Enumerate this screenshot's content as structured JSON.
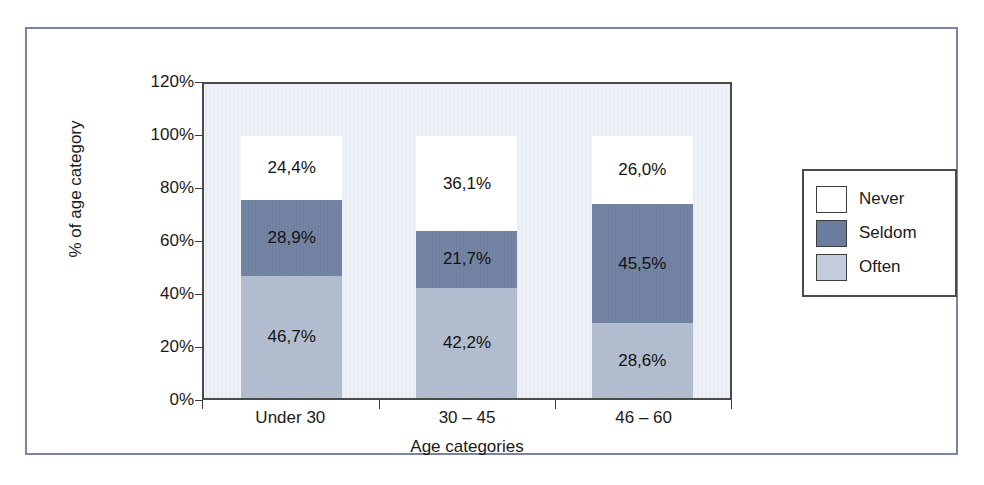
{
  "chart_data": {
    "type": "bar",
    "subtype": "stacked-percentage",
    "title": "",
    "xlabel": "Age categories",
    "ylabel": "% of age category",
    "categories": [
      "Under 30",
      "30 – 45",
      "46 – 60"
    ],
    "ylim": [
      0,
      120
    ],
    "yticks": [
      "0%",
      "20%",
      "40%",
      "60%",
      "80%",
      "100%",
      "120%"
    ],
    "ytick_values": [
      0,
      20,
      40,
      60,
      80,
      100,
      120
    ],
    "grid": false,
    "legend_position": "right",
    "stack_order_bottom_to_top": [
      "Often",
      "Seldom",
      "Never"
    ],
    "series": [
      {
        "name": "Often",
        "color": "#aeb9cc",
        "values": [
          46.7,
          42.2,
          28.6
        ],
        "labels": [
          "46,7%",
          "42,2%",
          "28,6%"
        ]
      },
      {
        "name": "Seldom",
        "color": "#6b7c9e",
        "values": [
          28.9,
          21.7,
          45.5
        ],
        "labels": [
          "28,9%",
          "21,7%",
          "45,5%"
        ]
      },
      {
        "name": "Never",
        "color": "#ffffff",
        "values": [
          24.4,
          36.1,
          26.0
        ],
        "labels": [
          "24,4%",
          "36,1%",
          "26,0%"
        ]
      }
    ]
  },
  "legend": {
    "items": [
      {
        "label": "Never",
        "color": "#ffffff"
      },
      {
        "label": "Seldom",
        "color": "#6b7c9e"
      },
      {
        "label": "Often",
        "color": "#c2ccdd"
      }
    ]
  },
  "bars": [
    {
      "category": "Under 30",
      "segments": [
        {
          "series": "Never",
          "label": "24,4%",
          "value": 24.4
        },
        {
          "series": "Seldom",
          "label": "28,9%",
          "value": 28.9
        },
        {
          "series": "Often",
          "label": "46,7%",
          "value": 46.7
        }
      ]
    },
    {
      "category": "30 – 45",
      "segments": [
        {
          "series": "Never",
          "label": "36,1%",
          "value": 36.1
        },
        {
          "series": "Seldom",
          "label": "21,7%",
          "value": 21.7
        },
        {
          "series": "Often",
          "label": "42,2%",
          "value": 42.2
        }
      ]
    },
    {
      "category": "46 – 60",
      "segments": [
        {
          "series": "Never",
          "label": "26,0%",
          "value": 26.0
        },
        {
          "series": "Seldom",
          "label": "45,5%",
          "value": 45.5
        },
        {
          "series": "Often",
          "label": "28,6%",
          "value": 28.6
        }
      ]
    }
  ],
  "artifacts": {
    "bleed_through_text": "ed the Tactful Lie and the Seesaw on Multiple Levels"
  }
}
